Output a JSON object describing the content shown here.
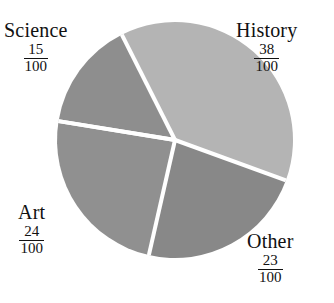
{
  "chart_data": {
    "type": "pie",
    "title": "",
    "subtitle": "",
    "xlabel": "",
    "ylabel": "",
    "legend_position": "none",
    "grid": false,
    "denominator": 100,
    "total": 100,
    "categories": [
      "History",
      "Other",
      "Art",
      "Science"
    ],
    "values": [
      38,
      23,
      24,
      15
    ],
    "slices": [
      {
        "label": "History",
        "value": 38,
        "numerator": "38",
        "denominator": "100",
        "fraction": "38/100",
        "percent": 38,
        "color": "#b4b4b4",
        "start_angle": -20,
        "end_angle": 116.8,
        "label_position": "top-right"
      },
      {
        "label": "Other",
        "value": 23,
        "numerator": "23",
        "denominator": "100",
        "fraction": "23/100",
        "percent": 23,
        "color": "#888888",
        "start_angle": -102.8,
        "end_angle": -20,
        "label_position": "bottom-right"
      },
      {
        "label": "Art",
        "value": 24,
        "numerator": "24",
        "denominator": "100",
        "fraction": "24/100",
        "percent": 24,
        "color": "#909090",
        "start_angle": -189.2,
        "end_angle": -102.8,
        "label_position": "bottom-left"
      },
      {
        "label": "Science",
        "value": 15,
        "numerator": "15",
        "denominator": "100",
        "fraction": "15/100",
        "percent": 15,
        "color": "#8e8e8e",
        "start_angle": 116.8,
        "end_angle": 170.8,
        "label_position": "top-left"
      }
    ],
    "geometry": {
      "center_x": 175,
      "center_y": 140,
      "radius": 118,
      "separator_color": "#ffffff",
      "separator_width": 4
    },
    "background_color": "#ffffff",
    "text_color": "#111111"
  }
}
